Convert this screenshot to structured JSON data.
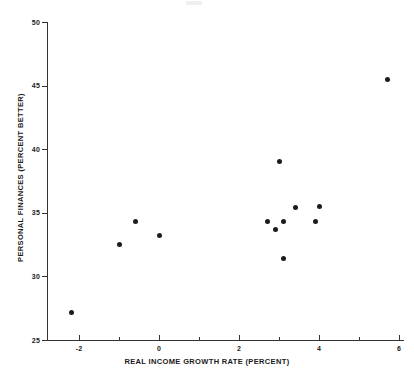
{
  "chart_data": {
    "type": "scatter",
    "title": "",
    "xlabel": "REAL INCOME GROWTH RATE (PERCENT)",
    "ylabel": "PERSONAL FINANCES (PERCENT BETTER)",
    "xlim": [
      -2.8,
      6.1
    ],
    "ylim": [
      25,
      50
    ],
    "grid": false,
    "legend": null,
    "xticks": [
      -2,
      0,
      2,
      4,
      6
    ],
    "xtick_labels": [
      "-2",
      "0",
      "2",
      "4",
      "6"
    ],
    "xticks_minor": [
      -1,
      1,
      3,
      5
    ],
    "yticks": [
      25,
      30,
      35,
      40,
      45,
      50
    ],
    "ytick_labels": [
      "25",
      "30",
      "35",
      "40",
      "45",
      "50"
    ],
    "marker": "filled-circle",
    "marker_color": "#1c1c1c",
    "points": [
      {
        "x": -2.2,
        "y": 27.2
      },
      {
        "x": -1.0,
        "y": 32.5
      },
      {
        "x": -0.6,
        "y": 34.3
      },
      {
        "x": 0.0,
        "y": 33.2
      },
      {
        "x": 2.7,
        "y": 34.3
      },
      {
        "x": 2.9,
        "y": 33.7
      },
      {
        "x": 3.0,
        "y": 39.0
      },
      {
        "x": 3.1,
        "y": 34.3
      },
      {
        "x": 3.1,
        "y": 31.4
      },
      {
        "x": 3.4,
        "y": 35.4
      },
      {
        "x": 3.9,
        "y": 34.3
      },
      {
        "x": 4.0,
        "y": 35.5
      },
      {
        "x": 5.7,
        "y": 45.5
      }
    ]
  }
}
